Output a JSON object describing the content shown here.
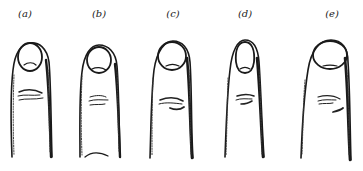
{
  "figure": {
    "panels": [
      {
        "id": "a",
        "label": "(a)",
        "nail_shape": "round"
      },
      {
        "id": "b",
        "label": "(b)",
        "nail_shape": "short-round"
      },
      {
        "id": "c",
        "label": "(c)",
        "nail_shape": "round-large"
      },
      {
        "id": "d",
        "label": "(d)",
        "nail_shape": "narrow-long"
      },
      {
        "id": "e",
        "label": "(e)",
        "nail_shape": "broad-oval"
      }
    ]
  },
  "colors": {
    "background": "#ffffff",
    "ink": "#1a1a1a"
  }
}
